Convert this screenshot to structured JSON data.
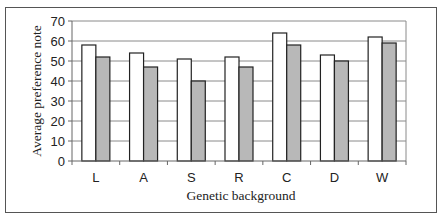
{
  "chart_data": {
    "type": "bar",
    "title": "",
    "xlabel": "Genetic background",
    "ylabel": "Average preference note",
    "categories": [
      "L",
      "A",
      "S",
      "R",
      "C",
      "D",
      "W"
    ],
    "series": [
      {
        "name": "Series 1 (white)",
        "color": "#ffffff",
        "values": [
          58,
          54,
          51,
          52,
          64,
          53,
          62
        ]
      },
      {
        "name": "Series 2 (gray)",
        "color": "#b8b8b8",
        "values": [
          52,
          47,
          40,
          47,
          58,
          50,
          59
        ]
      }
    ],
    "ylim": [
      0,
      70
    ],
    "yticks": [
      0,
      10,
      20,
      30,
      40,
      50,
      60,
      70
    ],
    "grid": true,
    "legend": "none"
  }
}
